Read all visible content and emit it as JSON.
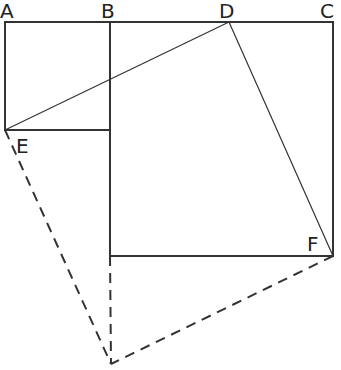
{
  "diagram": {
    "labels": {
      "A": "A",
      "B": "B",
      "C": "C",
      "D": "D",
      "E": "E",
      "F": "F"
    },
    "points": {
      "A": [
        5,
        22
      ],
      "B": [
        110,
        22
      ],
      "D": [
        229,
        22
      ],
      "C": [
        333,
        22
      ],
      "E": [
        5,
        130
      ],
      "F": [
        333,
        256
      ],
      "G": [
        111,
        364
      ]
    },
    "colors": {
      "line": "#333333",
      "background": "#ffffff"
    }
  }
}
